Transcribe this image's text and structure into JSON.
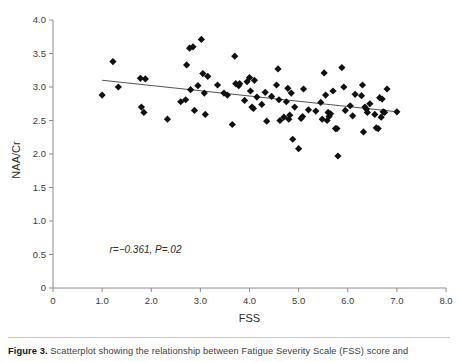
{
  "figure": {
    "caption_prefix": "Figure 3.",
    "caption_text": " Scatterplot showing the relationship between Fatigue Severity Scale (FSS) score and",
    "annotation": "r=−0.361, P=.02"
  },
  "colors": {
    "marker": "#101010",
    "regression_line": "#555555",
    "axis": "#8a8a8a",
    "background": "#ffffff",
    "caption_rule": "#c9c9c9"
  },
  "chart_data": {
    "type": "scatter",
    "title": "",
    "xlabel": "FSS",
    "ylabel": "NAA/Cr",
    "xlim": [
      0,
      8.0
    ],
    "ylim": [
      0,
      4.0
    ],
    "xticks": [
      0,
      1.0,
      2.0,
      3.0,
      4.0,
      5.0,
      6.0,
      7.0,
      8.0
    ],
    "xticklabels": [
      "0",
      "1.0",
      "2.0",
      "3.0",
      "4.0",
      "5.0",
      "6.0",
      "7.0",
      "8.0"
    ],
    "yticks": [
      0,
      0.5,
      1.0,
      1.5,
      2.0,
      2.5,
      3.0,
      3.5,
      4.0
    ],
    "yticklabels": [
      "0",
      "0.5",
      "1.0",
      "1.5",
      "2.0",
      "2.5",
      "3.0",
      "3.5",
      "4.0"
    ],
    "grid": false,
    "legend": false,
    "marker_style": "diamond",
    "annotations": [
      {
        "text": "r=−0.361, P=.02",
        "x": 1.15,
        "y": 0.52
      }
    ],
    "statistics": {
      "r": -0.361,
      "p": 0.02,
      "n": 95
    },
    "regression_line": {
      "x": [
        1.0,
        7.0
      ],
      "y": [
        3.1,
        2.63
      ],
      "slope": -0.0783,
      "intercept": 3.178
    },
    "points": [
      [
        1.0,
        2.88
      ],
      [
        1.22,
        3.38
      ],
      [
        1.33,
        3.0
      ],
      [
        1.78,
        3.13
      ],
      [
        1.8,
        2.7
      ],
      [
        1.85,
        2.62
      ],
      [
        1.88,
        3.12
      ],
      [
        2.33,
        2.52
      ],
      [
        2.7,
        2.81
      ],
      [
        2.72,
        3.33
      ],
      [
        2.78,
        3.58
      ],
      [
        2.8,
        2.96
      ],
      [
        2.85,
        3.6
      ],
      [
        2.88,
        2.65
      ],
      [
        3.02,
        3.71
      ],
      [
        3.05,
        3.2
      ],
      [
        3.08,
        2.91
      ],
      [
        3.1,
        2.59
      ],
      [
        3.15,
        3.16
      ],
      [
        3.35,
        3.03
      ],
      [
        3.48,
        2.91
      ],
      [
        3.65,
        2.44
      ],
      [
        3.7,
        3.46
      ],
      [
        3.72,
        3.05
      ],
      [
        3.78,
        3.02
      ],
      [
        3.8,
        3.05
      ],
      [
        3.95,
        3.08
      ],
      [
        4.0,
        3.14
      ],
      [
        4.02,
        2.94
      ],
      [
        4.05,
        2.7
      ],
      [
        4.08,
        2.68
      ],
      [
        4.1,
        3.1
      ],
      [
        4.32,
        2.92
      ],
      [
        4.35,
        2.49
      ],
      [
        4.55,
        3.03
      ],
      [
        4.58,
        3.27
      ],
      [
        4.6,
        2.81
      ],
      [
        4.62,
        2.5
      ],
      [
        4.7,
        2.55
      ],
      [
        4.75,
        2.78
      ],
      [
        4.78,
        2.98
      ],
      [
        4.8,
        2.52
      ],
      [
        4.82,
        2.58
      ],
      [
        4.85,
        2.91
      ],
      [
        4.88,
        2.22
      ],
      [
        5.0,
        2.08
      ],
      [
        5.05,
        2.53
      ],
      [
        5.08,
        2.56
      ],
      [
        5.1,
        2.97
      ],
      [
        5.45,
        2.77
      ],
      [
        5.52,
        3.21
      ],
      [
        5.55,
        2.88
      ],
      [
        5.58,
        2.5
      ],
      [
        5.6,
        2.62
      ],
      [
        5.62,
        2.56
      ],
      [
        5.65,
        2.6
      ],
      [
        5.7,
        2.94
      ],
      [
        5.75,
        2.38
      ],
      [
        5.78,
        2.38
      ],
      [
        5.8,
        1.97
      ],
      [
        5.88,
        3.29
      ],
      [
        5.92,
        3.0
      ],
      [
        6.05,
        2.72
      ],
      [
        6.15,
        2.89
      ],
      [
        6.28,
        2.87
      ],
      [
        6.3,
        3.03
      ],
      [
        6.32,
        2.33
      ],
      [
        6.35,
        2.7
      ],
      [
        6.38,
        2.67
      ],
      [
        6.4,
        2.62
      ],
      [
        6.55,
        2.59
      ],
      [
        6.58,
        2.39
      ],
      [
        6.62,
        2.38
      ],
      [
        6.65,
        2.84
      ],
      [
        6.7,
        2.82
      ],
      [
        6.72,
        2.63
      ],
      [
        6.75,
        2.62
      ],
      [
        6.8,
        2.97
      ],
      [
        7.0,
        2.63
      ],
      [
        4.45,
        2.86
      ],
      [
        5.35,
        2.64
      ],
      [
        3.55,
        2.88
      ],
      [
        2.95,
        3.02
      ],
      [
        4.25,
        2.74
      ],
      [
        5.2,
        2.66
      ],
      [
        6.1,
        2.57
      ],
      [
        3.9,
        2.8
      ],
      [
        4.92,
        2.7
      ],
      [
        5.48,
        2.52
      ],
      [
        6.45,
        2.75
      ],
      [
        2.6,
        2.78
      ],
      [
        4.15,
        2.85
      ],
      [
        5.95,
        2.65
      ],
      [
        6.68,
        2.55
      ]
    ]
  }
}
